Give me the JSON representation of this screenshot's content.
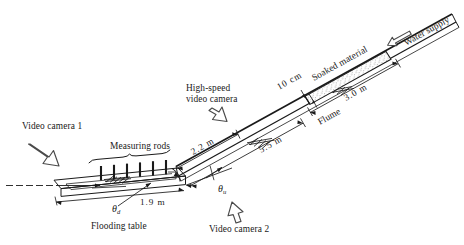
{
  "figure": {
    "type": "apparatus-schematic",
    "background": "#ffffff",
    "ink_color": "#1a1a1a"
  },
  "labels": {
    "video_camera_1": "Video camera 1",
    "video_camera_2": "Video camera 2",
    "high_speed_camera_line1": "High-speed",
    "high_speed_camera_line2": "video camera",
    "measuring_rods": "Measuring rods",
    "flooding_table": "Flooding table",
    "flume": "Flume",
    "soaked_material": "Soaked material",
    "water_supply": "Water supply"
  },
  "dimensions": {
    "table_length": "1.9 m",
    "upper_table_span": "2.2 m",
    "flume_lower": "5.5 m",
    "flume_upper": "3.0 m",
    "material_depth": "10 cm"
  },
  "angles": {
    "downslope_symbol": "θ",
    "downslope_subscript": "d",
    "upslope_symbol": "θ",
    "upslope_subscript": "u"
  },
  "icons": {
    "arrow_camera1": "arrow-down-right-icon",
    "arrow_camera2": "arrow-up-icon",
    "arrow_high_speed": "arrow-down-icon",
    "arrow_water_supply": "arrow-left-icon"
  },
  "components": {
    "measuring_rod_count": 6,
    "brace": "curly-brace",
    "reference_line": "horizontal-datum-dashed"
  }
}
